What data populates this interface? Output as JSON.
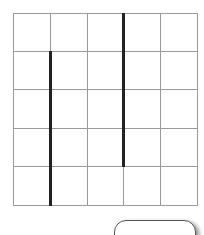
{
  "grid": {
    "rows": 5,
    "cols": 5,
    "origin": [
      13,
      13
    ],
    "col_edges": [
      13,
      50,
      87,
      123,
      160,
      197
    ],
    "row_edges": [
      13,
      51,
      89,
      128,
      166,
      205
    ],
    "line_color": "#9a9a9a",
    "wall_color": "#222222"
  },
  "walls": [
    {
      "orientation": "vertical",
      "col_edge_index": 1,
      "from_row_edge": 1,
      "to_row_edge": 5
    },
    {
      "orientation": "vertical",
      "col_edge_index": 3,
      "from_row_edge": 0,
      "to_row_edge": 4
    }
  ],
  "button": {
    "label": ""
  }
}
